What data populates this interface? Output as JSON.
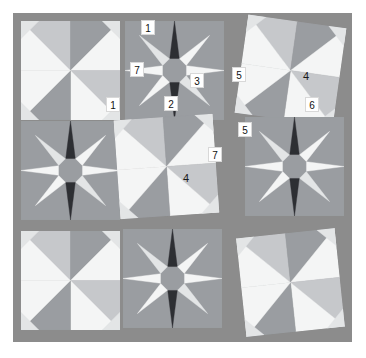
{
  "canvas": {
    "width": 366,
    "height": 358,
    "background": "#ffffff"
  },
  "quilt": {
    "title": "Quilt block sampler grid",
    "left": 13,
    "top": 13,
    "width": 339,
    "height": 329,
    "background_color": "#8c8c8c",
    "grid_rows": 3,
    "grid_cols": 3,
    "palette": {
      "background": "#8c8c8c",
      "dark_gray": "#6f7175",
      "mid_gray": "#9a9da1",
      "light_gray": "#c6c8cb",
      "pale": "#e3e5e6",
      "white": "#f4f5f5",
      "near_black": "#2d2f33",
      "shadow": "#7a7c80",
      "grid_line": "#b0b2b5"
    },
    "blocks": [
      {
        "id": "block-r1c1",
        "row": 1,
        "col": 1,
        "pattern": "pinwheel",
        "x": 8,
        "y": 8,
        "size": 99,
        "rotation": 0,
        "tone": "light"
      },
      {
        "id": "block-r1c2",
        "row": 1,
        "col": 2,
        "pattern": "star",
        "x": 112,
        "y": 8,
        "size": 99,
        "rotation": 0,
        "tone": "dark"
      },
      {
        "id": "block-r1c3",
        "row": 1,
        "col": 3,
        "pattern": "pinwheel",
        "x": 228,
        "y": 8,
        "size": 99,
        "rotation": 8,
        "tone": "light"
      },
      {
        "id": "block-r2c1",
        "row": 2,
        "col": 1,
        "pattern": "star",
        "x": 8,
        "y": 108,
        "size": 99,
        "rotation": 0,
        "tone": "dark"
      },
      {
        "id": "block-r2c2",
        "row": 2,
        "col": 2,
        "pattern": "pinwheel",
        "x": 104,
        "y": 104,
        "size": 99,
        "rotation": -4,
        "tone": "light"
      },
      {
        "id": "block-r2c3",
        "row": 2,
        "col": 3,
        "pattern": "star",
        "x": 232,
        "y": 104,
        "size": 99,
        "rotation": 0,
        "tone": "dark"
      },
      {
        "id": "block-r3c1",
        "row": 3,
        "col": 1,
        "pattern": "pinwheel",
        "x": 8,
        "y": 218,
        "size": 99,
        "rotation": 0,
        "tone": "light"
      },
      {
        "id": "block-r3c2",
        "row": 3,
        "col": 2,
        "pattern": "star",
        "x": 110,
        "y": 216,
        "size": 99,
        "rotation": 0,
        "tone": "dark"
      },
      {
        "id": "block-r3c3",
        "row": 3,
        "col": 3,
        "pattern": "pinwheel",
        "x": 228,
        "y": 220,
        "size": 99,
        "rotation": -6,
        "tone": "light"
      }
    ]
  },
  "annotations": {
    "style": "numbered-badges",
    "count": 10,
    "items": [
      {
        "id": "label-1a",
        "text": "1",
        "x": 141,
        "y": 20,
        "boxed": true
      },
      {
        "id": "label-7a",
        "text": "7",
        "x": 130,
        "y": 62,
        "boxed": true
      },
      {
        "id": "label-3",
        "text": "3",
        "x": 190,
        "y": 73,
        "boxed": true
      },
      {
        "id": "label-5a",
        "text": "5",
        "x": 232,
        "y": 67,
        "boxed": true
      },
      {
        "id": "label-4a",
        "text": "4",
        "x": 299,
        "y": 69,
        "boxed": false
      },
      {
        "id": "label-1b",
        "text": "1",
        "x": 106,
        "y": 97,
        "boxed": true
      },
      {
        "id": "label-2",
        "text": "2",
        "x": 164,
        "y": 96,
        "boxed": true
      },
      {
        "id": "label-6",
        "text": "6",
        "x": 305,
        "y": 97,
        "boxed": true
      },
      {
        "id": "label-5b",
        "text": "5",
        "x": 238,
        "y": 122,
        "boxed": true
      },
      {
        "id": "label-7b",
        "text": "7",
        "x": 208,
        "y": 147,
        "boxed": true
      },
      {
        "id": "label-4b",
        "text": "4",
        "x": 179,
        "y": 171,
        "boxed": false
      }
    ]
  }
}
